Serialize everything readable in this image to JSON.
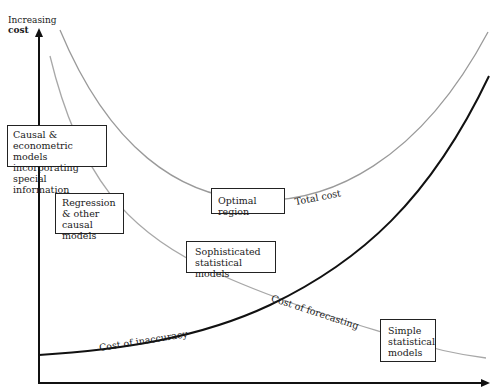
{
  "axes": {
    "y_label_line1": "Increasing",
    "y_label_line2": "cost"
  },
  "curves": {
    "total_cost": {
      "label": "Total cost",
      "color": "#9a9a9a"
    },
    "cost_of_forecasting": {
      "label": "Cost of forecasting",
      "color": "#a8a8a8"
    },
    "cost_of_inaccuracy": {
      "label": "Cost of inaccuracy",
      "color": "#111111"
    }
  },
  "boxes": {
    "causal": {
      "line1": "Causal & econometric",
      "line2": "models incorporating",
      "line3": "special information"
    },
    "regression": {
      "line1": "Regression",
      "line2": "& other",
      "line3": "causal models"
    },
    "optimal": {
      "line1": "Optimal region"
    },
    "sophisticated": {
      "line1": "Sophisticated",
      "line2": "statistical models"
    },
    "simple": {
      "line1": "Simple",
      "line2": "statistical",
      "line3": "models"
    }
  }
}
